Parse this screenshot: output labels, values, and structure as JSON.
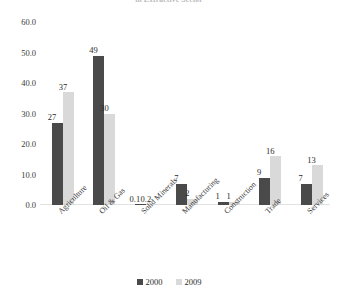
{
  "chart_data": {
    "type": "bar",
    "title": "in Extractive Sector",
    "xlabel": "",
    "ylabel": "",
    "ylim": [
      0,
      60
    ],
    "ytick_step": 10,
    "ytick_labels": [
      "0.0",
      "10.0",
      "20.0",
      "30.0",
      "40.0",
      "50.0",
      "60.0"
    ],
    "grid": false,
    "legend_position": "bottom",
    "categories": [
      "Agriculture",
      "Oil & Gas",
      "Solid Minerals",
      "Manufacturing",
      "Construction",
      "Trade",
      "Services"
    ],
    "series": [
      {
        "name": "2000",
        "color": "#4a4a4a",
        "values": [
          27,
          49,
          0.1,
          7,
          1,
          9,
          7
        ],
        "labels": [
          "27",
          "49",
          "0.1",
          "7",
          "1",
          "9",
          "7"
        ]
      },
      {
        "name": "2009",
        "color": "#d9d9d9",
        "values": [
          37,
          30,
          0.2,
          2,
          1,
          16,
          13
        ],
        "labels": [
          "37",
          "30",
          "0.2",
          "2",
          "1",
          "16",
          "13"
        ]
      }
    ]
  }
}
